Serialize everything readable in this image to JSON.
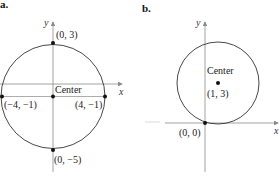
{
  "panels": [
    {
      "label": "a.",
      "axes": {
        "x_label": "x",
        "y_label": "y"
      },
      "circle": {
        "center": [
          0,
          -1
        ],
        "radius": 4
      },
      "center_text": "Center",
      "points": [
        {
          "coord": [
            0,
            3
          ],
          "text": "(0, 3)"
        },
        {
          "coord": [
            -4,
            -1
          ],
          "text": "(−4, −1)"
        },
        {
          "coord": [
            4,
            -1
          ],
          "text": "(4, −1)"
        },
        {
          "coord": [
            0,
            -5
          ],
          "text": "(0, −5)"
        },
        {
          "coord": [
            0,
            -1
          ],
          "text": ""
        }
      ]
    },
    {
      "label": "b.",
      "axes": {
        "x_label": "x",
        "y_label": "y"
      },
      "circle": {
        "center": [
          1,
          3
        ],
        "radius": 3.16
      },
      "center_text": "Center",
      "points": [
        {
          "coord": [
            1,
            3
          ],
          "text": "(1, 3)"
        },
        {
          "coord": [
            0,
            0
          ],
          "text": "(0, 0)"
        }
      ]
    }
  ],
  "colors": {
    "axis": "#8a8a8a",
    "circle": "#333333",
    "point": "#111111"
  }
}
